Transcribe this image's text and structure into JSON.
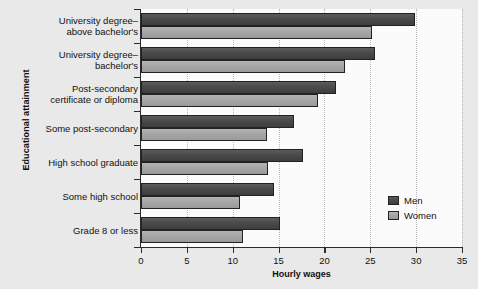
{
  "chart_data": {
    "type": "bar",
    "orientation": "horizontal",
    "title": "",
    "xlabel": "Hourly wages",
    "ylabel": "Educational attainment",
    "xlim": [
      0,
      35
    ],
    "xticks": [
      0,
      5,
      10,
      15,
      20,
      25,
      30,
      35
    ],
    "grid": "vertical-dotted",
    "legend_position": "right-lower",
    "categories": [
      "University degree–above bachelor's",
      "University degree–bachelor's",
      "Post-secondary certificate or diploma",
      "Some post-secondary",
      "High school graduate",
      "Some high school",
      "Grade 8 or less"
    ],
    "category_lines": [
      [
        "University degree–",
        "above bachelor's"
      ],
      [
        "University degree–",
        "bachelor's"
      ],
      [
        "Post-secondary",
        "certificate or diploma"
      ],
      [
        "Some post-secondary"
      ],
      [
        "High school graduate"
      ],
      [
        "Some high school"
      ],
      [
        "Grade 8 or less"
      ]
    ],
    "series": [
      {
        "name": "Men",
        "color": "#4a4a4a",
        "values": [
          29.9,
          25.5,
          21.3,
          16.7,
          17.7,
          14.5,
          15.2
        ]
      },
      {
        "name": "Women",
        "color": "#a6a6a6",
        "values": [
          25.2,
          22.2,
          19.3,
          13.7,
          13.9,
          10.8,
          11.1
        ]
      }
    ]
  },
  "axis": {
    "x_title": "Hourly wages",
    "y_title": "Educational attainment",
    "x_tick_labels": [
      "0",
      "5",
      "10",
      "15",
      "20",
      "25",
      "30",
      "35"
    ]
  },
  "legend": {
    "items": [
      {
        "label": "Men"
      },
      {
        "label": "Women"
      }
    ]
  },
  "colors": {
    "page_background": "#e9e9e9",
    "plot_background": "#fbfbfb",
    "men_bar": "#4a4a4a",
    "women_bar": "#a6a6a6",
    "axis": "#2b2b2b",
    "gridline": "#b9b9b9"
  }
}
